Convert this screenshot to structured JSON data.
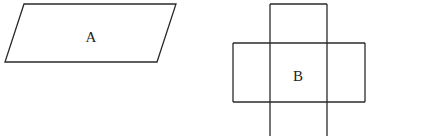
{
  "figures": {
    "parallelogram": {
      "label": "A",
      "points": [
        [
          24,
          4
        ],
        [
          176,
          4
        ],
        [
          157,
          62
        ],
        [
          5,
          62
        ]
      ]
    },
    "cross_net": {
      "label": "B",
      "column": {
        "x_left": 270,
        "x_right": 327,
        "y_top": 4,
        "y_bottom": 136
      },
      "row": {
        "x_left": 233,
        "x_right": 365,
        "y_top": 43,
        "y_bottom": 102
      }
    }
  },
  "colors": {
    "stroke": "#2a2a2a",
    "background": "#ffffff"
  }
}
